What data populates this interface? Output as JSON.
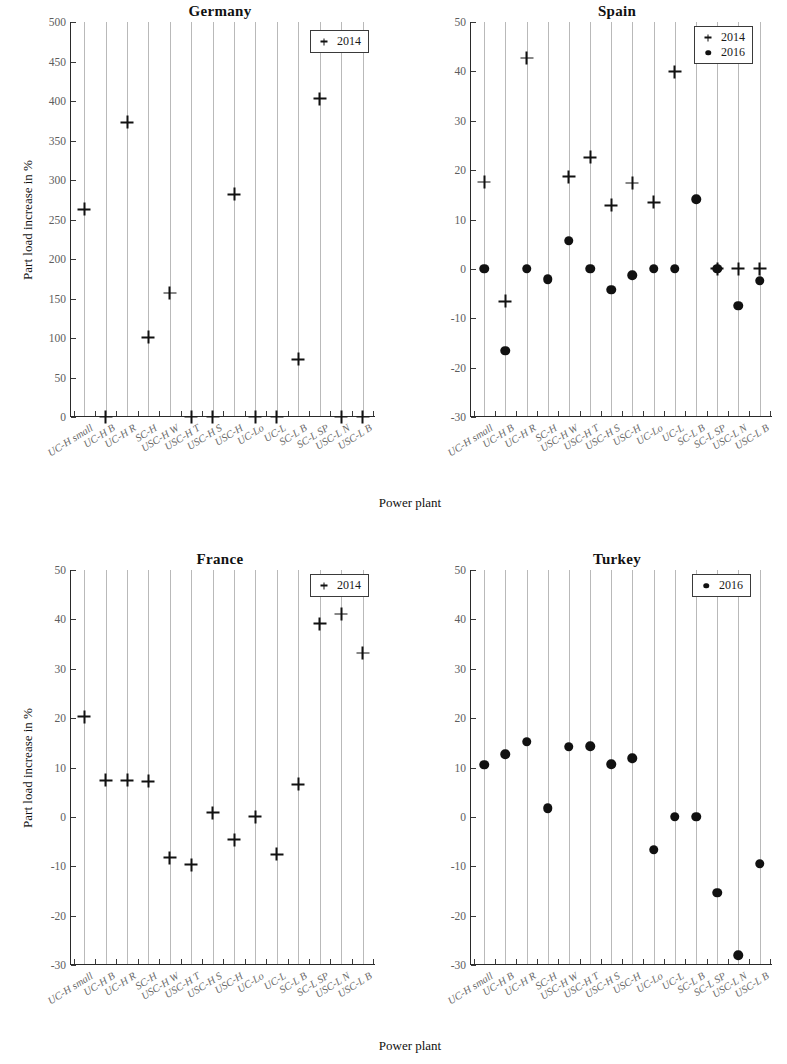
{
  "figure": {
    "axis_titles": {
      "y": "Part load increase in %",
      "x": "Power plant"
    }
  },
  "categories": [
    "UC-H small",
    "UC-H B",
    "UC-H R",
    "SC-H",
    "USC-H W",
    "USC-H T",
    "USC-H S",
    "USC-H",
    "UC-Lo",
    "UC-L",
    "SC-L B",
    "SC-L SP",
    "USC-L N",
    "USC-L B"
  ],
  "legend_labels": {
    "y2014": "2014",
    "y2016": "2016"
  },
  "panels": [
    {
      "key": "germany",
      "title": "Germany"
    },
    {
      "key": "spain",
      "title": "Spain"
    },
    {
      "key": "france",
      "title": "France"
    },
    {
      "key": "turkey",
      "title": "Turkey"
    }
  ],
  "chart_data": [
    {
      "type": "scatter",
      "title": "Germany",
      "xlabel": "Power plant",
      "ylabel": "Part load increase in %",
      "ylim": [
        0,
        500
      ],
      "yticks": [
        0,
        50,
        100,
        150,
        200,
        250,
        300,
        350,
        400,
        450,
        500
      ],
      "grid": "vertical",
      "legend_position": "top-right",
      "categories": [
        "UC-H small",
        "UC-H B",
        "UC-H R",
        "SC-H",
        "USC-H W",
        "USC-H T",
        "USC-H S",
        "USC-H",
        "UC-Lo",
        "UC-L",
        "SC-L B",
        "SC-L SP",
        "USC-L N",
        "USC-L B"
      ],
      "series": [
        {
          "name": "2014",
          "marker": "plus",
          "values": [
            263,
            0,
            373,
            101,
            157,
            0,
            0,
            282,
            0,
            0,
            73,
            403,
            0,
            0
          ]
        }
      ]
    },
    {
      "type": "scatter",
      "title": "Spain",
      "xlabel": "Power plant",
      "ylabel": "Part load increase in %",
      "ylim": [
        -30,
        50
      ],
      "yticks": [
        -30,
        -20,
        -10,
        0,
        10,
        20,
        30,
        40,
        50
      ],
      "grid": "vertical",
      "legend_position": "top-right",
      "categories": [
        "UC-H small",
        "UC-H B",
        "UC-H R",
        "SC-H",
        "USC-H W",
        "USC-H T",
        "USC-H S",
        "USC-H",
        "UC-Lo",
        "UC-L",
        "SC-L B",
        "SC-L SP",
        "USC-L N",
        "USC-L B"
      ],
      "series": [
        {
          "name": "2014",
          "marker": "plus",
          "values": [
            17.6,
            -6.6,
            42.7,
            null,
            18.7,
            22.6,
            12.9,
            17.4,
            13.5,
            39.9,
            null,
            0,
            0,
            0
          ]
        },
        {
          "name": "2016",
          "marker": "dot",
          "values": [
            0,
            -16.6,
            0,
            -2.1,
            5.7,
            0,
            -4.2,
            -1.3,
            0,
            0,
            14.1,
            0,
            -7.5,
            -2.4
          ]
        }
      ]
    },
    {
      "type": "scatter",
      "title": "France",
      "xlabel": "Power plant",
      "ylabel": "Part load increase in %",
      "ylim": [
        -30,
        50
      ],
      "yticks": [
        -30,
        -20,
        -10,
        0,
        10,
        20,
        30,
        40,
        50
      ],
      "grid": "vertical",
      "legend_position": "top-right",
      "categories": [
        "UC-H small",
        "UC-H B",
        "UC-H R",
        "SC-H",
        "USC-H W",
        "USC-H T",
        "USC-H S",
        "USC-H",
        "UC-Lo",
        "UC-L",
        "SC-L B",
        "SC-L SP",
        "USC-L N",
        "USC-L B"
      ],
      "series": [
        {
          "name": "2014",
          "marker": "plus",
          "values": [
            20.3,
            7.4,
            7.4,
            7.2,
            -8.3,
            -9.7,
            0.8,
            -4.6,
            0.0,
            -7.6,
            6.6,
            39.1,
            41.1,
            33.2
          ]
        }
      ]
    },
    {
      "type": "scatter",
      "title": "Turkey",
      "xlabel": "Power plant",
      "ylabel": "Part load increase in %",
      "ylim": [
        -30,
        50
      ],
      "yticks": [
        -30,
        -20,
        -10,
        0,
        10,
        20,
        30,
        40,
        50
      ],
      "grid": "vertical",
      "legend_position": "top-right",
      "categories": [
        "UC-H small",
        "UC-H B",
        "UC-H R",
        "SC-H",
        "USC-H W",
        "USC-H T",
        "USC-H S",
        "USC-H",
        "UC-Lo",
        "UC-L",
        "SC-L B",
        "SC-L SP",
        "USC-L N",
        "USC-L B"
      ],
      "series": [
        {
          "name": "2016",
          "marker": "dot",
          "values": [
            10.6,
            12.7,
            15.2,
            1.7,
            14.2,
            14.3,
            10.7,
            11.9,
            -6.7,
            0.0,
            0.0,
            -15.4,
            -28.0,
            -9.5
          ]
        }
      ]
    }
  ]
}
